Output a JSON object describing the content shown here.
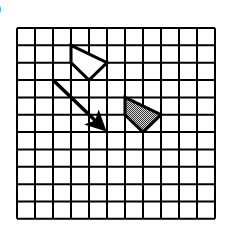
{
  "label": ")",
  "grid": {
    "cols": 11,
    "rows": 11,
    "left": 17,
    "top": 28,
    "cell_w": 18,
    "cell_h": 17.35,
    "line_color": "#000000"
  },
  "shapes": {
    "original": {
      "name": "original-quadrilateral",
      "fill": "#ffffff",
      "vertices": [
        [
          3,
          1
        ],
        [
          5,
          2
        ],
        [
          4,
          3
        ],
        [
          3,
          2
        ]
      ]
    },
    "image": {
      "name": "translated-quadrilateral",
      "fill": "shaded",
      "vertices": [
        [
          6,
          4
        ],
        [
          8,
          5
        ],
        [
          7,
          6
        ],
        [
          6,
          5
        ]
      ]
    }
  },
  "arrow": {
    "from": [
      2,
      3
    ],
    "to": [
      5,
      6
    ]
  },
  "colors": {
    "shade_dark": "#3a3a3a",
    "shade_light": "#d8d8d8",
    "stroke": "#000000"
  }
}
